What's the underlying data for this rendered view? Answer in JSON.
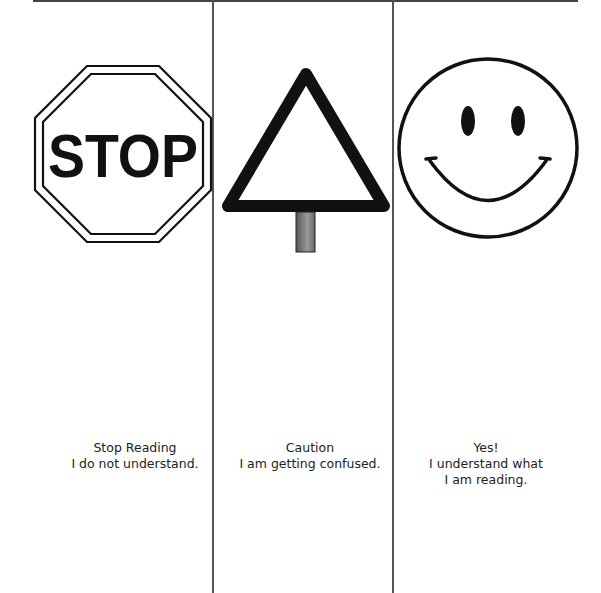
{
  "columns": [
    {
      "id": "stop",
      "icon": "stop-sign-icon",
      "sign_text": "STOP",
      "caption": [
        "Stop Reading",
        "I do not understand."
      ]
    },
    {
      "id": "caution",
      "icon": "caution-triangle-sign-icon",
      "caption": [
        "Caution",
        "I am getting confused."
      ]
    },
    {
      "id": "yes",
      "icon": "smiley-face-icon",
      "caption": [
        "Yes!",
        "I understand what",
        "I am reading."
      ]
    }
  ],
  "colors": {
    "ink": "#111111",
    "rule": "#555555",
    "post": "#777777"
  }
}
